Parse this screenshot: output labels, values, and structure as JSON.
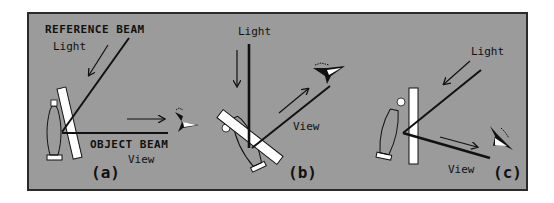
{
  "figure": {
    "background": "#ffffff",
    "frame_fill": "#9b9b9b",
    "frame_border": "#2a2a2a",
    "ink": "#111111",
    "plate_fill": "#ffffff"
  },
  "panels": [
    {
      "id": "a",
      "label": "(a)",
      "labels": {
        "reference_beam": "REFERENCE BEAM",
        "light": "Light",
        "object_beam": "OBJECT BEAM",
        "view": "View"
      }
    },
    {
      "id": "b",
      "label": "(b)",
      "labels": {
        "light": "Light",
        "view": "View"
      }
    },
    {
      "id": "c",
      "label": "(c)",
      "labels": {
        "light": "Light",
        "view": "View"
      }
    }
  ],
  "icons": {
    "object": "bottle-object-icon",
    "plate": "holographic-plate-icon",
    "viewer": "eye-viewer-icon",
    "arrow": "arrow-icon"
  }
}
